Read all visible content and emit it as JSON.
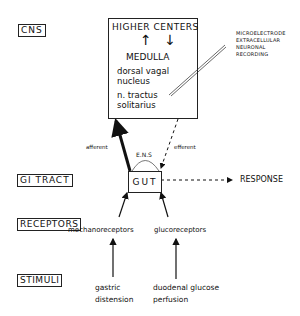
{
  "levels": {
    "cns": "CNS",
    "gi_tract": "GI TRACT",
    "receptors": "RECEPTORS",
    "stimuli": "STIMULI"
  },
  "cns_box": {
    "higher_centers": "HIGHER CENTERS",
    "arrows": "↑ ↓",
    "medulla": "MEDULLA",
    "dorsal_vagal_1": "dorsal vagal",
    "dorsal_vagal_2": "nucleus",
    "nts_1": "n. tractus",
    "nts_2": "solitarius"
  },
  "recording": {
    "line1": "MICROELECTRODE",
    "line2": "EXTRACELLULAR",
    "line3": "NEURONAL",
    "line4": "RECORDING"
  },
  "gut": {
    "label": "GUT",
    "ens": "E.N.S",
    "afferent": "afferent",
    "efferent": "efferent",
    "response": "RESPONSE"
  },
  "receptors": {
    "mechano": "mechanoreceptors",
    "gluco": "glucoreceptors"
  },
  "stimuli": {
    "gastric_1": "gastric",
    "gastric_2": "distension",
    "duodenal_1": "duodenal glucose",
    "duodenal_2": "perfusion"
  }
}
